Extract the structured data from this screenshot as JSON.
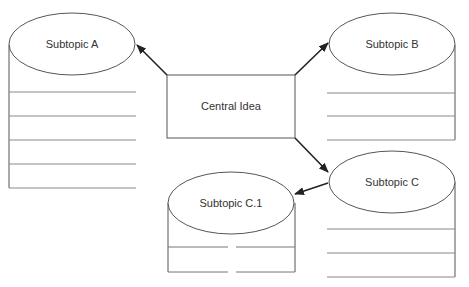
{
  "diagram": {
    "type": "mind-map",
    "colors": {
      "line": "#555555",
      "arrow": "#222222",
      "background": "#ffffff"
    },
    "central": {
      "label": "Central Idea"
    },
    "subtopics": [
      {
        "id": "A",
        "label": "Subtopic A",
        "lines": 5
      },
      {
        "id": "B",
        "label": "Subtopic B",
        "lines": 3
      },
      {
        "id": "C",
        "label": "Subtopic C",
        "lines": 3
      },
      {
        "id": "C1",
        "label": "Subtopic C.1",
        "lines": 2,
        "parent": "C"
      }
    ],
    "edges": [
      {
        "from": "Central Idea",
        "to": "Subtopic A"
      },
      {
        "from": "Central Idea",
        "to": "Subtopic B"
      },
      {
        "from": "Central Idea",
        "to": "Subtopic C"
      },
      {
        "from": "Subtopic C",
        "to": "Subtopic C.1"
      }
    ]
  }
}
